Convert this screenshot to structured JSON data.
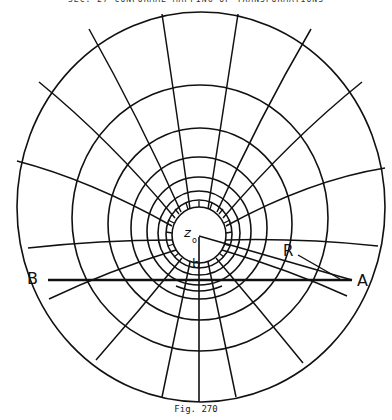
{
  "header": {
    "text": "SEC. 27   CONFORMAL MAPPING  OF  TRANSFORMATIONS"
  },
  "caption": {
    "text": "Fig. 270"
  },
  "labels": {
    "point_b_left": "B",
    "point_a_right": "A",
    "radius": "R",
    "center_symbol": "z",
    "center_subscript": "o",
    "segment": "b"
  },
  "geometry": {
    "center": [
      199,
      237
    ],
    "baseline_y": 280,
    "B": [
      48,
      280
    ],
    "A": [
      352,
      280
    ],
    "stroke_color": "#111111",
    "background": "#ffffff"
  }
}
